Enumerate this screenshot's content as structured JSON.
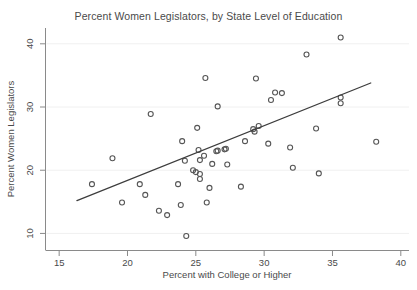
{
  "chart_data": {
    "type": "scatter",
    "title": "Percent Women Legislators, by State Level of Education",
    "xlabel": "Percent with College or Higher",
    "ylabel": "Percent Women Legislators",
    "xlim": [
      14.0,
      40.6
    ],
    "ylim": [
      7.3,
      42.5
    ],
    "xticks": [
      15,
      20,
      25,
      30,
      35,
      40
    ],
    "yticks": [
      10,
      20,
      30,
      40
    ],
    "xtick_labels": [
      "15",
      "20",
      "25",
      "30",
      "35",
      "40"
    ],
    "ytick_labels": [
      "10",
      "20",
      "30",
      "40"
    ],
    "grid": true,
    "grid_axis": "y",
    "legend": null,
    "marker": "open-circle",
    "marker_color": "#555555",
    "points": [
      {
        "x": 17.4,
        "y": 17.8
      },
      {
        "x": 18.9,
        "y": 21.9
      },
      {
        "x": 19.6,
        "y": 14.9
      },
      {
        "x": 20.9,
        "y": 17.8
      },
      {
        "x": 21.3,
        "y": 16.1
      },
      {
        "x": 21.7,
        "y": 28.9
      },
      {
        "x": 22.3,
        "y": 13.6
      },
      {
        "x": 22.9,
        "y": 12.9
      },
      {
        "x": 23.7,
        "y": 17.8
      },
      {
        "x": 23.9,
        "y": 14.5
      },
      {
        "x": 24.0,
        "y": 24.6
      },
      {
        "x": 24.2,
        "y": 21.5
      },
      {
        "x": 24.3,
        "y": 9.6
      },
      {
        "x": 24.8,
        "y": 20.0
      },
      {
        "x": 25.0,
        "y": 19.7
      },
      {
        "x": 25.1,
        "y": 26.7
      },
      {
        "x": 25.2,
        "y": 23.2
      },
      {
        "x": 25.3,
        "y": 21.6
      },
      {
        "x": 25.3,
        "y": 19.4
      },
      {
        "x": 25.3,
        "y": 18.6
      },
      {
        "x": 25.6,
        "y": 22.3
      },
      {
        "x": 25.7,
        "y": 34.6
      },
      {
        "x": 25.8,
        "y": 14.9
      },
      {
        "x": 26.0,
        "y": 17.2
      },
      {
        "x": 26.2,
        "y": 21.0
      },
      {
        "x": 26.5,
        "y": 23.0
      },
      {
        "x": 26.6,
        "y": 23.1
      },
      {
        "x": 26.6,
        "y": 30.1
      },
      {
        "x": 27.1,
        "y": 23.3
      },
      {
        "x": 27.2,
        "y": 23.4
      },
      {
        "x": 27.3,
        "y": 20.9
      },
      {
        "x": 28.3,
        "y": 17.4
      },
      {
        "x": 28.6,
        "y": 24.6
      },
      {
        "x": 29.2,
        "y": 26.5
      },
      {
        "x": 29.3,
        "y": 26.1
      },
      {
        "x": 29.4,
        "y": 34.5
      },
      {
        "x": 29.6,
        "y": 27.0
      },
      {
        "x": 30.3,
        "y": 24.2
      },
      {
        "x": 30.5,
        "y": 31.1
      },
      {
        "x": 30.8,
        "y": 32.3
      },
      {
        "x": 31.3,
        "y": 32.2
      },
      {
        "x": 31.9,
        "y": 23.6
      },
      {
        "x": 32.1,
        "y": 20.4
      },
      {
        "x": 33.1,
        "y": 38.3
      },
      {
        "x": 33.8,
        "y": 26.6
      },
      {
        "x": 34.0,
        "y": 19.5
      },
      {
        "x": 35.6,
        "y": 41.0
      },
      {
        "x": 35.6,
        "y": 31.5
      },
      {
        "x": 35.6,
        "y": 30.6
      },
      {
        "x": 38.2,
        "y": 24.5
      }
    ],
    "fit_line": {
      "x_start": 16.3,
      "y_start": 15.2,
      "x_end": 37.8,
      "y_end": 33.8,
      "color": "#3d3d3d"
    }
  }
}
